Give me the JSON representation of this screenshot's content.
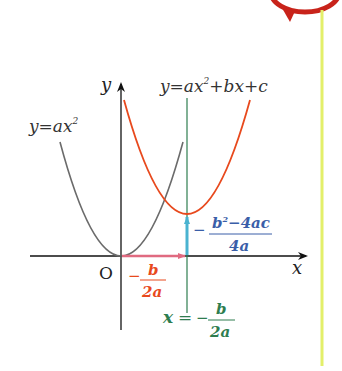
{
  "diagram": {
    "axes": {
      "x_label": "x",
      "y_label": "y",
      "origin_label": "O"
    },
    "curves": [
      {
        "name": "base-parabola",
        "label_prefix": "y=ax",
        "label_sup": "2",
        "color": "#6b6b6b"
      },
      {
        "name": "translated-parabola",
        "label_prefix": "y=ax",
        "label_sup": "2",
        "label_suffix": "+bx+c",
        "color": "#e8491d"
      }
    ],
    "horizontal_shift": {
      "sign": "−",
      "numerator": "b",
      "denominator": "2a",
      "color": "#e8491d",
      "arrow_color": "#e06a80"
    },
    "vertical_shift": {
      "sign": "−",
      "numerator_base": "b",
      "numerator_sup": "2",
      "numerator_rest": "−4ac",
      "denominator": "4a",
      "color": "#3a5ea8",
      "arrow_color": "#4ab3d0"
    },
    "axis_of_symmetry": {
      "lhs": "x",
      "eq": "=",
      "sign": "−",
      "numerator": "b",
      "denominator": "2a",
      "color": "#2e7d4f"
    },
    "decor": {
      "margin_line_color": "#e3ef6a",
      "bubble_color": "#c8231a"
    }
  }
}
